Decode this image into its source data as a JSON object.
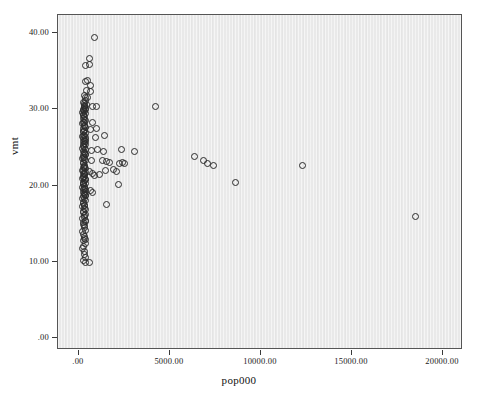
{
  "chart_data": {
    "type": "scatter",
    "title": "",
    "xlabel": "pop000",
    "ylabel": "vmt",
    "xlim": [
      -1150,
      21100
    ],
    "ylim": [
      -1.6,
      42.4
    ],
    "grid": false,
    "legend": "none",
    "marker": "open-circle",
    "marker_color": "#2b2b2b",
    "panel_color": "#e9e9e9",
    "xticks": [
      0,
      5000,
      10000,
      15000,
      20000
    ],
    "xtick_labels": [
      ".00",
      "5000.00",
      "10000.00",
      "15000.00",
      "20000.00"
    ],
    "yticks": [
      0,
      10,
      20,
      30,
      40
    ],
    "ytick_labels": [
      ".00",
      "10.00",
      "20.00",
      "30.00",
      "40.00"
    ],
    "n_points": 178,
    "points": [
      [
        824,
        39.5
      ],
      [
        549,
        36.8
      ],
      [
        330,
        35.8
      ],
      [
        549,
        35.9
      ],
      [
        357,
        33.7
      ],
      [
        467,
        33.8
      ],
      [
        604,
        33.2
      ],
      [
        412,
        32.6
      ],
      [
        632,
        32.4
      ],
      [
        330,
        31.6
      ],
      [
        467,
        31.6
      ],
      [
        357,
        31.2
      ],
      [
        247,
        31.0
      ],
      [
        302,
        30.9
      ],
      [
        385,
        30.7
      ],
      [
        302,
        30.4
      ],
      [
        275,
        30.3
      ],
      [
        330,
        30.2
      ],
      [
        247,
        30.1
      ],
      [
        357,
        30.0
      ],
      [
        220,
        29.9
      ],
      [
        275,
        29.8
      ],
      [
        192,
        29.6
      ],
      [
        330,
        29.5
      ],
      [
        247,
        29.3
      ],
      [
        302,
        29.1
      ],
      [
        220,
        28.9
      ],
      [
        714,
        30.5
      ],
      [
        961,
        30.4
      ],
      [
        4170,
        30.4
      ],
      [
        275,
        28.7
      ],
      [
        330,
        28.6
      ],
      [
        247,
        28.4
      ],
      [
        192,
        28.2
      ],
      [
        302,
        28.0
      ],
      [
        714,
        28.4
      ],
      [
        275,
        27.8
      ],
      [
        357,
        27.7
      ],
      [
        220,
        27.5
      ],
      [
        302,
        27.3
      ],
      [
        247,
        27.1
      ],
      [
        604,
        27.4
      ],
      [
        934,
        27.6
      ],
      [
        330,
        26.9
      ],
      [
        275,
        26.7
      ],
      [
        192,
        26.5
      ],
      [
        357,
        26.4
      ],
      [
        247,
        26.2
      ],
      [
        302,
        26.0
      ],
      [
        879,
        26.4
      ],
      [
        1400,
        26.7
      ],
      [
        220,
        25.8
      ],
      [
        275,
        25.6
      ],
      [
        330,
        25.4
      ],
      [
        247,
        25.2
      ],
      [
        302,
        25.1
      ],
      [
        192,
        24.9
      ],
      [
        357,
        24.8
      ],
      [
        220,
        24.6
      ],
      [
        275,
        24.4
      ],
      [
        686,
        24.7
      ],
      [
        1016,
        24.8
      ],
      [
        1345,
        24.6
      ],
      [
        2333,
        24.8
      ],
      [
        3046,
        24.6
      ],
      [
        8571,
        20.5
      ],
      [
        330,
        24.2
      ],
      [
        247,
        24.0
      ],
      [
        302,
        23.8
      ],
      [
        192,
        23.6
      ],
      [
        275,
        23.5
      ],
      [
        357,
        23.3
      ],
      [
        220,
        23.1
      ],
      [
        247,
        22.9
      ],
      [
        659,
        23.4
      ],
      [
        1263,
        23.3
      ],
      [
        1510,
        23.2
      ],
      [
        1675,
        23.1
      ],
      [
        2196,
        23.0
      ],
      [
        2388,
        23.1
      ],
      [
        2470,
        22.9
      ],
      [
        12253,
        22.7
      ],
      [
        302,
        22.7
      ],
      [
        275,
        22.5
      ],
      [
        330,
        22.3
      ],
      [
        192,
        22.1
      ],
      [
        247,
        22.0
      ],
      [
        357,
        21.8
      ],
      [
        220,
        21.6
      ],
      [
        275,
        21.5
      ],
      [
        302,
        21.3
      ],
      [
        247,
        21.1
      ],
      [
        192,
        21.0
      ],
      [
        330,
        20.8
      ],
      [
        275,
        20.7
      ],
      [
        220,
        20.5
      ],
      [
        357,
        20.4
      ],
      [
        247,
        20.2
      ],
      [
        302,
        20.0
      ],
      [
        549,
        21.9
      ],
      [
        714,
        21.7
      ],
      [
        824,
        21.4
      ],
      [
        1098,
        21.5
      ],
      [
        1455,
        22.1
      ],
      [
        1867,
        22.2
      ],
      [
        2059,
        21.9
      ],
      [
        6318,
        23.9
      ],
      [
        6840,
        23.3
      ],
      [
        7033,
        22.9
      ],
      [
        7363,
        22.7
      ],
      [
        192,
        19.8
      ],
      [
        275,
        19.7
      ],
      [
        247,
        19.5
      ],
      [
        330,
        19.3
      ],
      [
        220,
        19.1
      ],
      [
        302,
        19.0
      ],
      [
        357,
        18.8
      ],
      [
        247,
        18.6
      ],
      [
        192,
        18.4
      ],
      [
        275,
        18.3
      ],
      [
        330,
        18.1
      ],
      [
        220,
        17.9
      ],
      [
        604,
        19.4
      ],
      [
        741,
        19.1
      ],
      [
        1510,
        17.6
      ],
      [
        2141,
        20.2
      ],
      [
        18489,
        16.0
      ],
      [
        247,
        17.7
      ],
      [
        302,
        17.5
      ],
      [
        192,
        17.3
      ],
      [
        275,
        17.1
      ],
      [
        357,
        16.9
      ],
      [
        220,
        16.7
      ],
      [
        247,
        16.5
      ],
      [
        330,
        16.3
      ],
      [
        302,
        16.1
      ],
      [
        275,
        15.9
      ],
      [
        192,
        15.7
      ],
      [
        357,
        15.5
      ],
      [
        247,
        15.2
      ],
      [
        220,
        15.0
      ],
      [
        302,
        14.8
      ],
      [
        275,
        14.5
      ],
      [
        330,
        14.2
      ],
      [
        192,
        14.0
      ],
      [
        247,
        13.7
      ],
      [
        302,
        13.4
      ],
      [
        275,
        13.1
      ],
      [
        220,
        12.8
      ],
      [
        357,
        12.5
      ],
      [
        247,
        12.1
      ],
      [
        192,
        11.8
      ],
      [
        302,
        11.4
      ],
      [
        275,
        11.0
      ],
      [
        330,
        10.6
      ],
      [
        247,
        10.2
      ],
      [
        357,
        9.9
      ],
      [
        549,
        10.0
      ],
      [
        220,
        21.2
      ],
      [
        235,
        26.6
      ],
      [
        262,
        28.3
      ],
      [
        289,
        24.3
      ],
      [
        316,
        26.1
      ],
      [
        343,
        20.9
      ],
      [
        206,
        25.5
      ],
      [
        233,
        23.7
      ],
      [
        260,
        22.6
      ],
      [
        287,
        21.7
      ],
      [
        314,
        19.6
      ],
      [
        341,
        18.7
      ],
      [
        209,
        27.2
      ],
      [
        236,
        29.4
      ],
      [
        263,
        30.6
      ],
      [
        290,
        31.9
      ],
      [
        317,
        25.9
      ],
      [
        344,
        24.1
      ],
      [
        211,
        22.4
      ],
      [
        238,
        20.3
      ],
      [
        265,
        18.9
      ],
      [
        292,
        17.4
      ],
      [
        319,
        15.3
      ],
      [
        346,
        13.0
      ]
    ]
  }
}
